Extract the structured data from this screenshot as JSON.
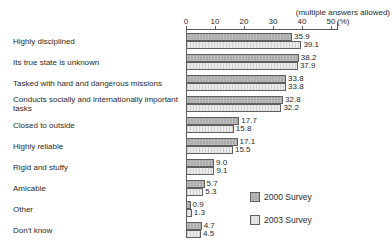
{
  "chart_data": {
    "type": "bar",
    "orientation": "horizontal",
    "title": "",
    "annotation": "(multiple answers allowed)",
    "x_unit": "(%)",
    "x_ticks": [
      0,
      10,
      20,
      30,
      40,
      50
    ],
    "xlim": [
      0,
      50
    ],
    "grid": false,
    "legend_position": "bottom-right",
    "categories": [
      "Highly disciplined",
      "Its true state is unknown",
      "Tasked with hard and dangerous missions",
      "Conducts socially and internationally important tasks",
      "Closed to outside",
      "Highly reliable",
      "Rigid and stuffy",
      "Amicable",
      "Other",
      "Don't know"
    ],
    "series": [
      {
        "name": "2000 Survey",
        "color": "#a7a7a7",
        "values": [
          35.9,
          38.2,
          33.8,
          32.8,
          17.7,
          17.1,
          9.0,
          5.7,
          0.9,
          4.7
        ],
        "labels": [
          "35.9",
          "38.2",
          "33.8",
          "32.8",
          "17.7",
          "17.1",
          "9.0",
          "5.7",
          "0.9",
          "4.7"
        ]
      },
      {
        "name": "2003 Survey",
        "color": "#ebebeb",
        "values": [
          39.1,
          37.9,
          33.8,
          32.2,
          15.8,
          15.5,
          9.1,
          5.3,
          1.3,
          4.5
        ],
        "labels": [
          "39.1",
          "37.9",
          "33.8",
          "32.2",
          "15.8",
          "15.5",
          "9.1",
          "5.3",
          "1.3",
          "4.5"
        ]
      }
    ]
  }
}
